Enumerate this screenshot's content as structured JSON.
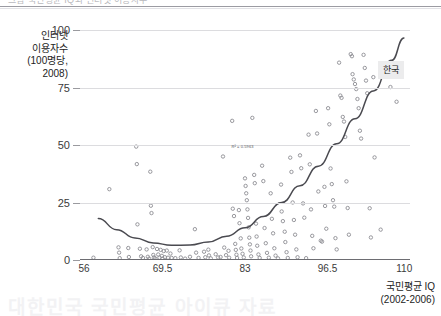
{
  "page": {
    "top_cut_text": "그림   국민평균 IQ와 인터넷 이용자수",
    "bottom_watermark": "대한민국 국민평균 아이큐 자료"
  },
  "chart_data": {
    "type": "scatter",
    "title": "",
    "xlabel": "국민평균 IQ\n(2002-2006)",
    "xlabel_line1": "국민평균 IQ",
    "xlabel_line2": "(2002-2006)",
    "ylabel_line1": "인터넷",
    "ylabel_line2": "이용자수",
    "ylabel_line3": "(100명당,",
    "ylabel_line4": "2008)",
    "xlim": [
      56,
      110
    ],
    "ylim": [
      0,
      100
    ],
    "xticks": [
      "56",
      "69.5",
      "83",
      "96.5",
      "110"
    ],
    "xtick_values": [
      56,
      69.5,
      83,
      96.5,
      110
    ],
    "yticks": [
      "0",
      "25",
      "50",
      "75",
      "100"
    ],
    "ytick_values": [
      0,
      25,
      50,
      75,
      100
    ],
    "grid": "horizontal",
    "legend_position": "none",
    "marker": "open-circle",
    "marker_color": "#8d8d93",
    "curve_color": "#4a4a50",
    "gridline_color": "#dcdcdf",
    "annotations": [
      {
        "name": "korea-callout",
        "text": "한국",
        "x": 104.8,
        "y": 83.5,
        "background": "#ececed"
      },
      {
        "name": "r-squared",
        "text": "R² = 0.5963",
        "x": 82.6,
        "y": 49.5
      }
    ],
    "trend": {
      "type": "quadratic",
      "note": "2차 추세선",
      "points_xy": [
        [
          59.0,
          18.0
        ],
        [
          62.0,
          13.2
        ],
        [
          65.0,
          9.6
        ],
        [
          68.0,
          7.4
        ],
        [
          71.0,
          6.4
        ],
        [
          74.0,
          6.5
        ],
        [
          77.0,
          7.8
        ],
        [
          80.0,
          10.3
        ],
        [
          83.0,
          14.0
        ],
        [
          86.0,
          18.9
        ],
        [
          89.0,
          25.0
        ],
        [
          92.0,
          32.3
        ],
        [
          95.0,
          40.8
        ],
        [
          98.0,
          50.5
        ],
        [
          101.0,
          61.4
        ],
        [
          104.0,
          73.5
        ],
        [
          107.0,
          86.8
        ],
        [
          109.0,
          96.5
        ]
      ]
    },
    "series": [
      {
        "name": "국가별 관측치",
        "points": [
          [
            58.2,
            1.0
          ],
          [
            60.8,
            30.8
          ],
          [
            62.3,
            5.5
          ],
          [
            62.4,
            3.2
          ],
          [
            62.5,
            0.8
          ],
          [
            63.9,
            5.2
          ],
          [
            64.0,
            1.3
          ],
          [
            65.2,
            49.3
          ],
          [
            65.3,
            41.7
          ],
          [
            65.4,
            15.5
          ],
          [
            65.8,
            4.9
          ],
          [
            66.0,
            1.6
          ],
          [
            66.3,
            0.9
          ],
          [
            66.9,
            4.6
          ],
          [
            67.1,
            1.4
          ],
          [
            67.3,
            0.6
          ],
          [
            67.5,
            38.4
          ],
          [
            67.6,
            23.6
          ],
          [
            67.7,
            20.4
          ],
          [
            67.9,
            5.6
          ],
          [
            68.0,
            2.2
          ],
          [
            68.1,
            1.1
          ],
          [
            68.3,
            0.7
          ],
          [
            68.6,
            4.8
          ],
          [
            68.8,
            2.4
          ],
          [
            69.0,
            1.0
          ],
          [
            69.2,
            4.4
          ],
          [
            69.4,
            1.8
          ],
          [
            69.5,
            0.6
          ],
          [
            69.7,
            3.9
          ],
          [
            69.9,
            1.2
          ],
          [
            70.2,
            4.1
          ],
          [
            70.4,
            1.0
          ],
          [
            70.8,
            2.8
          ],
          [
            71.0,
            0.9
          ],
          [
            71.6,
            0.8
          ],
          [
            72.3,
            4.2
          ],
          [
            72.5,
            1.1
          ],
          [
            73.2,
            0.6
          ],
          [
            74.0,
            1.4
          ],
          [
            74.8,
            13.4
          ],
          [
            75.0,
            3.2
          ],
          [
            75.4,
            0.9
          ],
          [
            76.3,
            3.6
          ],
          [
            76.5,
            1.2
          ],
          [
            77.0,
            4.5
          ],
          [
            77.1,
            2.0
          ],
          [
            77.4,
            0.7
          ],
          [
            78.2,
            2.5
          ],
          [
            78.6,
            1.1
          ],
          [
            79.0,
            1.3
          ],
          [
            79.4,
            45.0
          ],
          [
            79.6,
            5.4
          ],
          [
            79.9,
            2.1
          ],
          [
            80.3,
            4.0
          ],
          [
            80.4,
            1.0
          ],
          [
            80.9,
            60.5
          ],
          [
            81.0,
            22.3
          ],
          [
            81.2,
            19.1
          ],
          [
            81.4,
            7.0
          ],
          [
            81.5,
            4.4
          ],
          [
            81.6,
            2.3
          ],
          [
            81.7,
            0.9
          ],
          [
            82.0,
            21.7
          ],
          [
            82.1,
            16.0
          ],
          [
            82.3,
            9.4
          ],
          [
            82.4,
            5.0
          ],
          [
            82.6,
            2.7
          ],
          [
            82.8,
            1.1
          ],
          [
            83.0,
            35.5
          ],
          [
            83.1,
            32.2
          ],
          [
            83.2,
            29.0
          ],
          [
            83.3,
            26.0
          ],
          [
            83.4,
            22.0
          ],
          [
            83.5,
            18.3
          ],
          [
            83.6,
            14.2
          ],
          [
            83.7,
            9.7
          ],
          [
            83.8,
            6.8
          ],
          [
            83.9,
            4.1
          ],
          [
            84.0,
            1.6
          ],
          [
            84.2,
            61.8
          ],
          [
            84.5,
            37.0
          ],
          [
            84.6,
            33.4
          ],
          [
            84.8,
            15.8
          ],
          [
            84.9,
            10.2
          ],
          [
            85.0,
            6.2
          ],
          [
            85.2,
            2.4
          ],
          [
            85.4,
            0.9
          ],
          [
            85.8,
            41.0
          ],
          [
            86.0,
            34.3
          ],
          [
            86.2,
            13.9
          ],
          [
            86.4,
            7.3
          ],
          [
            86.6,
            3.1
          ],
          [
            86.9,
            1.0
          ],
          [
            87.2,
            29.0
          ],
          [
            87.4,
            17.9
          ],
          [
            87.6,
            11.6
          ],
          [
            87.8,
            5.1
          ],
          [
            88.0,
            1.9
          ],
          [
            88.4,
            0.7
          ],
          [
            88.9,
            32.8
          ],
          [
            89.0,
            21.1
          ],
          [
            89.2,
            16.9
          ],
          [
            89.5,
            12.3
          ],
          [
            89.6,
            7.8
          ],
          [
            89.8,
            3.4
          ],
          [
            90.0,
            0.9
          ],
          [
            90.4,
            44.5
          ],
          [
            90.6,
            38.3
          ],
          [
            90.8,
            25.0
          ],
          [
            91.0,
            17.4
          ],
          [
            91.2,
            11.0
          ],
          [
            91.4,
            4.6
          ],
          [
            91.6,
            1.2
          ],
          [
            92.0,
            45.5
          ],
          [
            92.2,
            39.9
          ],
          [
            92.5,
            24.6
          ],
          [
            92.7,
            18.4
          ],
          [
            93.0,
            0.8
          ],
          [
            93.4,
            54.5
          ],
          [
            93.6,
            41.6
          ],
          [
            93.8,
            22.0
          ],
          [
            94.0,
            10.5
          ],
          [
            94.2,
            5.1
          ],
          [
            94.6,
            64.8
          ],
          [
            94.8,
            55.0
          ],
          [
            95.0,
            29.8
          ],
          [
            95.4,
            8.4
          ],
          [
            95.6,
            8.0
          ],
          [
            96.0,
            31.8
          ],
          [
            96.1,
            23.5
          ],
          [
            96.3,
            13.6
          ],
          [
            96.6,
            66.0
          ],
          [
            96.8,
            59.0
          ],
          [
            97.0,
            39.8
          ],
          [
            97.2,
            33.0
          ],
          [
            97.4,
            26.0
          ],
          [
            97.6,
            23.2
          ],
          [
            97.8,
            9.5
          ],
          [
            98.0,
            4.6
          ],
          [
            98.4,
            85.8
          ],
          [
            98.6,
            71.5
          ],
          [
            98.8,
            70.5
          ],
          [
            99.0,
            62.2
          ],
          [
            99.2,
            60.2
          ],
          [
            99.4,
            53.5
          ],
          [
            99.6,
            34.2
          ],
          [
            99.8,
            22.6
          ],
          [
            100.0,
            11.0
          ],
          [
            100.3,
            89.5
          ],
          [
            100.5,
            88.6
          ],
          [
            100.6,
            80.8
          ],
          [
            100.8,
            78.5
          ],
          [
            101.0,
            76.5
          ],
          [
            101.2,
            74.3
          ],
          [
            101.4,
            70.0
          ],
          [
            101.6,
            66.0
          ],
          [
            101.8,
            56.2
          ],
          [
            102.0,
            52.8
          ],
          [
            102.4,
            89.2
          ],
          [
            102.6,
            83.5
          ],
          [
            102.8,
            78.0
          ],
          [
            103.0,
            72.5
          ],
          [
            103.4,
            22.5
          ],
          [
            103.6,
            9.8
          ],
          [
            104.0,
            79.5
          ],
          [
            104.2,
            44.6
          ],
          [
            105.2,
            13.2
          ],
          [
            106.4,
            80.0
          ],
          [
            106.8,
            75.2
          ],
          [
            107.8,
            68.8
          ]
        ]
      }
    ]
  }
}
